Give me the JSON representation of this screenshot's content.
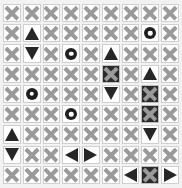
{
  "board": {
    "title": "symbol-grid",
    "columns": 9,
    "rows": 9,
    "colors": {
      "background": "#f2f2f2",
      "cell_background": "#ffffff",
      "cell_border": "#cfcfcf",
      "x_mark": "#9a9a9a",
      "dark_symbol": "#262626",
      "filled_cell": "#2b2b2b"
    },
    "symbol_legend": {
      "x": "x-mark",
      "up": "triangle-up",
      "down": "triangle-down",
      "left": "triangle-left",
      "right": "triangle-right",
      "ring": "ring",
      "x_filled": "x-mark-on-filled-cell"
    },
    "cells": [
      [
        "x",
        "x",
        "x",
        "x",
        "x",
        "x",
        "x",
        "x",
        "x"
      ],
      [
        "x",
        "up",
        "x",
        "x",
        "x",
        "x",
        "x",
        "ring",
        "x"
      ],
      [
        "x",
        "down",
        "x",
        "ring",
        "x",
        "up",
        "x",
        "x",
        "x"
      ],
      [
        "x",
        "x",
        "x",
        "x",
        "x",
        "x_filled",
        "x",
        "up",
        "x"
      ],
      [
        "x",
        "ring",
        "x",
        "x",
        "x",
        "down",
        "x",
        "x_filled",
        "x"
      ],
      [
        "x",
        "x",
        "x",
        "ring",
        "x",
        "x",
        "x",
        "x_filled",
        "x"
      ],
      [
        "up",
        "x",
        "x",
        "x",
        "x",
        "x",
        "x",
        "down",
        "x"
      ],
      [
        "down",
        "x",
        "x",
        "left",
        "right",
        "x",
        "x",
        "x",
        "x"
      ],
      [
        "x",
        "x",
        "x",
        "x",
        "x",
        "x",
        "left",
        "x_filled",
        "right"
      ]
    ]
  }
}
